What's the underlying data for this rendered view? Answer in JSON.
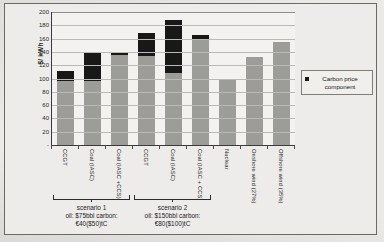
{
  "chart_data": {
    "type": "bar",
    "title": "",
    "xlabel": "",
    "ylabel": "$/ kWh",
    "ylim": [
      0,
      200
    ],
    "yticks": [
      "-",
      "20",
      "40",
      "60",
      "80",
      "100",
      "120",
      "140",
      "160",
      "180",
      "200"
    ],
    "grid": true,
    "stacked": true,
    "legend_position": "right",
    "legend": [
      "Carbon price component"
    ],
    "categories": [
      "CCGT",
      "Coal (IASC)",
      "Coal (IASC +CCS)",
      "CCGT",
      "Coal (IASC)",
      "Coal (IASC  + CCS)",
      "Nuclear",
      "Onshore wind (27%)",
      "Offshore wind (35%)"
    ],
    "series": [
      {
        "name": "Base cost",
        "color": "#9c9c99",
        "values": [
          97,
          97,
          136,
          134,
          108,
          160,
          98,
          133,
          155
        ]
      },
      {
        "name": "Carbon price component",
        "color": "#181818",
        "values": [
          15,
          41,
          4,
          34,
          80,
          6,
          0,
          0,
          0
        ]
      }
    ],
    "totals": [
      112,
      138,
      140,
      168,
      188,
      166,
      98,
      133,
      155
    ],
    "annotations": [
      {
        "title": "scenario 1",
        "line1": "oil: $75bbl carbon:",
        "line2": "€40($50)tC",
        "covers": [
          0,
          1,
          2
        ]
      },
      {
        "title": "scenario 2",
        "line1": "oil: $150bbl carbon:",
        "line2": "€80($100)tC",
        "covers": [
          3,
          4,
          5
        ]
      }
    ]
  },
  "colors": {
    "carbon": "#181818",
    "base": "#9c9c99",
    "grid": "#b9b9b6",
    "axis": "#3a3a3a",
    "paper": "#eceae6"
  }
}
